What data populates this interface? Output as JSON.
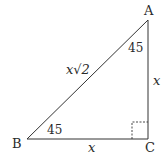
{
  "diagram": {
    "type": "right-isosceles-triangle",
    "vertices": {
      "A": {
        "label": "A",
        "x": 148,
        "y": 20
      },
      "B": {
        "label": "B",
        "x": 27,
        "y": 139
      },
      "C": {
        "label": "C",
        "x": 148,
        "y": 139
      }
    },
    "angles": {
      "A": "45",
      "B": "45"
    },
    "sides": {
      "AB": "x√2",
      "AC": "x",
      "BC": "x"
    },
    "right_angle_at": "C",
    "colors": {
      "stroke": "#333333",
      "text": "#2a2a2a",
      "background": "#ffffff"
    }
  }
}
